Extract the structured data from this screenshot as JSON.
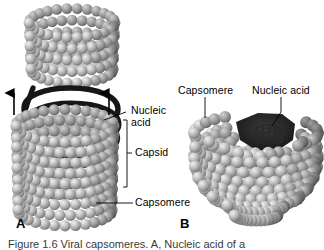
{
  "figure": {
    "background_color": "#ffffff",
    "sphere_color_light": "#d8d8d8",
    "sphere_color_mid": "#a8a8a8",
    "sphere_color_dark": "#707070",
    "nucleic_acid_color": "#1a1a1a",
    "line_color": "#000000"
  },
  "panel_a": {
    "letter": "A",
    "labels": {
      "nucleic_acid": "Nucleic\nacid",
      "capsid": "Capsid",
      "capsomere": "Capsomere"
    },
    "arrows": [
      {
        "name": "arrow-left",
        "direction": "up"
      },
      {
        "name": "arrow-right",
        "direction": "up"
      }
    ]
  },
  "panel_b": {
    "letter": "B",
    "labels": {
      "capsomere": "Capsomere",
      "nucleic_acid": "Nucleic acid"
    }
  },
  "caption": {
    "text": "Figure 1.6  Viral capsomeres. A, Nucleic acid of a"
  }
}
